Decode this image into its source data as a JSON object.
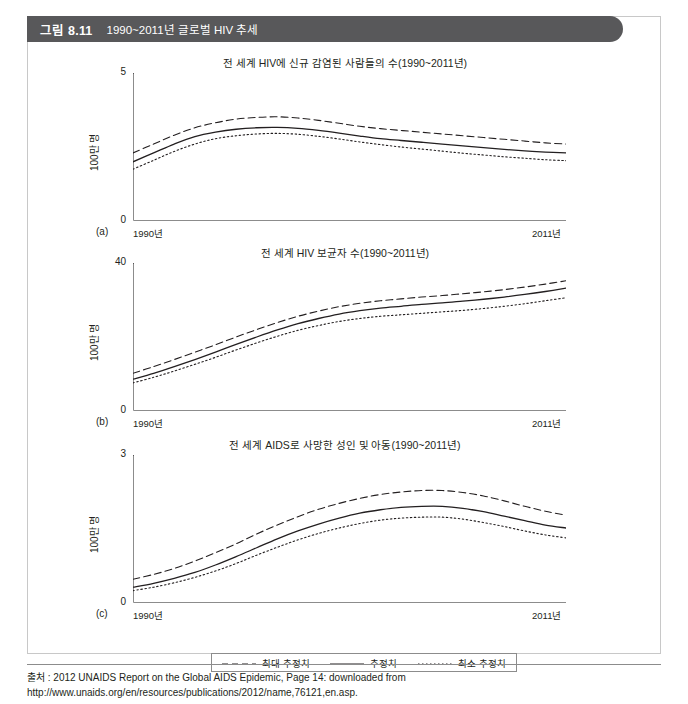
{
  "figure": {
    "number_label": "그림 8.11",
    "caption": "1990~2011년 글로벌 HIV 추세",
    "banner_color": "#58585a"
  },
  "legend": {
    "items": [
      {
        "label": "최대 추정치",
        "style": "dashed"
      },
      {
        "label": "추정치",
        "style": "solid"
      },
      {
        "label": "최소 추정치",
        "style": "dotted"
      }
    ]
  },
  "source": {
    "text": "출처 : 2012 UNAIDS Report on the Global AIDS Epidemic, Page 14: downloaded from http://www.unaids.org/en/resources/publications/2012/name,76121,en.asp."
  },
  "corner": {
    "mark": ""
  },
  "chart_data": [
    {
      "type": "line",
      "panel": "(a)",
      "title": "전 세계 HIV에 신규 감염된 사람들의 수(1990~2011년)",
      "xlabel": "",
      "ylabel": "100만 명",
      "ylim": [
        0,
        5
      ],
      "yticks": [
        0,
        5
      ],
      "xlim": [
        1990,
        2011
      ],
      "xticks": [
        1990,
        2011
      ],
      "xticklabels": [
        "1990년",
        "2011년"
      ],
      "grid": false,
      "legend_position": "below-figure",
      "x": [
        1990,
        1991,
        1992,
        1993,
        1994,
        1995,
        1996,
        1997,
        1998,
        1999,
        2000,
        2001,
        2002,
        2003,
        2004,
        2005,
        2006,
        2007,
        2008,
        2009,
        2010,
        2011
      ],
      "series": [
        {
          "name": "최대 추정치",
          "style": "dashed",
          "values": [
            2.3,
            2.6,
            2.9,
            3.15,
            3.32,
            3.44,
            3.5,
            3.52,
            3.48,
            3.4,
            3.3,
            3.2,
            3.12,
            3.06,
            3.0,
            2.94,
            2.88,
            2.82,
            2.76,
            2.7,
            2.64,
            2.6
          ]
        },
        {
          "name": "추정치",
          "style": "solid",
          "values": [
            2.0,
            2.3,
            2.6,
            2.85,
            3.0,
            3.1,
            3.15,
            3.16,
            3.13,
            3.06,
            2.97,
            2.87,
            2.78,
            2.72,
            2.66,
            2.6,
            2.54,
            2.48,
            2.42,
            2.37,
            2.33,
            2.3
          ]
        },
        {
          "name": "최소 추정치",
          "style": "dotted",
          "values": [
            1.75,
            2.05,
            2.35,
            2.6,
            2.78,
            2.88,
            2.94,
            2.96,
            2.93,
            2.86,
            2.77,
            2.67,
            2.58,
            2.5,
            2.43,
            2.36,
            2.29,
            2.23,
            2.17,
            2.12,
            2.07,
            2.04
          ]
        }
      ]
    },
    {
      "type": "line",
      "panel": "(b)",
      "title": "전 세계 HIV 보균자 수(1990~2011년)",
      "xlabel": "",
      "ylabel": "100만 명",
      "ylim": [
        0,
        40
      ],
      "yticks": [
        0,
        40
      ],
      "xlim": [
        1990,
        2011
      ],
      "xticks": [
        1990,
        2011
      ],
      "xticklabels": [
        "1990년",
        "2011년"
      ],
      "grid": false,
      "legend_position": "below-figure",
      "x": [
        1990,
        1991,
        1992,
        1993,
        1994,
        1995,
        1996,
        1997,
        1998,
        1999,
        2000,
        2001,
        2002,
        2003,
        2004,
        2005,
        2006,
        2007,
        2008,
        2009,
        2010,
        2011
      ],
      "series": [
        {
          "name": "최대 추정치",
          "style": "dashed",
          "values": [
            10.2,
            12.0,
            13.9,
            15.9,
            17.9,
            20.0,
            22.0,
            23.9,
            25.6,
            27.0,
            28.2,
            29.1,
            29.8,
            30.3,
            30.8,
            31.2,
            31.7,
            32.2,
            32.8,
            33.5,
            34.3,
            35.2
          ]
        },
        {
          "name": "추정치",
          "style": "solid",
          "values": [
            8.6,
            10.2,
            12.0,
            13.9,
            15.9,
            18.0,
            20.0,
            21.9,
            23.6,
            25.0,
            26.2,
            27.1,
            27.8,
            28.3,
            28.8,
            29.2,
            29.7,
            30.2,
            30.8,
            31.5,
            32.3,
            33.2
          ]
        },
        {
          "name": "최소 추정치",
          "style": "dotted",
          "values": [
            7.6,
            9.1,
            10.8,
            12.6,
            14.5,
            16.5,
            18.4,
            20.2,
            21.8,
            23.1,
            24.2,
            25.0,
            25.6,
            26.0,
            26.4,
            26.8,
            27.2,
            27.7,
            28.3,
            29.0,
            29.8,
            30.6
          ]
        }
      ]
    },
    {
      "type": "line",
      "panel": "(c)",
      "title": "전 세계 AIDS로 사망한 성인 및 아동(1990~2011년)",
      "xlabel": "",
      "ylabel": "100만 명",
      "ylim": [
        0,
        3
      ],
      "yticks": [
        0,
        3
      ],
      "xlim": [
        1990,
        2011
      ],
      "xticks": [
        1990,
        2011
      ],
      "xticklabels": [
        "1990년",
        "2011년"
      ],
      "grid": false,
      "legend_position": "below-figure",
      "x": [
        1990,
        1991,
        1992,
        1993,
        1994,
        1995,
        1996,
        1997,
        1998,
        1999,
        2000,
        2001,
        2002,
        2003,
        2004,
        2005,
        2006,
        2007,
        2008,
        2009,
        2010,
        2011
      ],
      "series": [
        {
          "name": "최대 추정치",
          "style": "dashed",
          "values": [
            0.48,
            0.58,
            0.7,
            0.85,
            1.02,
            1.2,
            1.4,
            1.58,
            1.75,
            1.9,
            2.02,
            2.12,
            2.2,
            2.25,
            2.28,
            2.28,
            2.24,
            2.17,
            2.07,
            1.96,
            1.86,
            1.78
          ]
        },
        {
          "name": "추정치",
          "style": "solid",
          "values": [
            0.32,
            0.4,
            0.5,
            0.62,
            0.77,
            0.94,
            1.12,
            1.3,
            1.46,
            1.6,
            1.72,
            1.82,
            1.89,
            1.94,
            1.96,
            1.96,
            1.92,
            1.85,
            1.76,
            1.67,
            1.58,
            1.52
          ]
        },
        {
          "name": "최소 추정치",
          "style": "dotted",
          "values": [
            0.25,
            0.32,
            0.41,
            0.52,
            0.65,
            0.8,
            0.97,
            1.13,
            1.28,
            1.41,
            1.52,
            1.61,
            1.68,
            1.72,
            1.74,
            1.74,
            1.7,
            1.63,
            1.55,
            1.46,
            1.38,
            1.32
          ]
        }
      ]
    }
  ]
}
